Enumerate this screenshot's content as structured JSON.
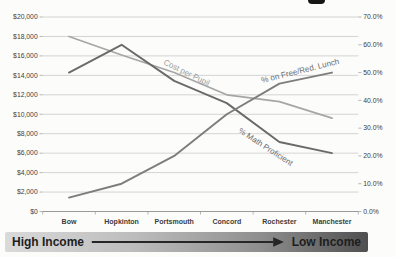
{
  "banner": {
    "left_label": "High Income",
    "right_label": "Low Income",
    "arrow_color": "#262626"
  },
  "chart_data": {
    "type": "line",
    "title": "",
    "categories": [
      "Bow",
      "Hopkinton",
      "Portsmouth",
      "Concord",
      "Rochester",
      "Manchester"
    ],
    "series": [
      {
        "name": "Cost per Pupil",
        "axis": "left",
        "values": [
          18000,
          16100,
          14300,
          12000,
          11300,
          9600
        ],
        "color": "#a6a6a6",
        "label_color": "#9c9c9c"
      },
      {
        "name": "% Math Proficient",
        "axis": "right",
        "values": [
          50,
          60,
          47,
          39,
          25,
          21
        ],
        "color": "#6a6a6a",
        "label_color": "#6b6b6b"
      },
      {
        "name": "% on Free/Red. Lunch",
        "axis": "right",
        "values": [
          5,
          10,
          20,
          35,
          46,
          50
        ],
        "color": "#7d7d7d",
        "label_color": "#6b6b6b"
      }
    ],
    "left_axis": {
      "min": 0,
      "max": 20000,
      "step": 2000,
      "tick_labels": [
        "$20,000",
        "$18,000",
        "$16,000",
        "$14,000",
        "$12,000",
        "$10,000",
        "$8,000",
        "$6,000",
        "$4,000",
        "$2,000",
        "$0"
      ]
    },
    "right_axis": {
      "min": 0,
      "max": 70,
      "step": 10,
      "tick_labels": [
        "70.0%",
        "60.0%",
        "50.0%",
        "40.0%",
        "30.0%",
        "20.0%",
        "10.0%",
        "0.0%"
      ]
    },
    "grid": true,
    "legend": "inline-rotated-labels",
    "colors": {
      "gridline": "#c9c9c9",
      "axis_line": "#9a9a9a",
      "tick_text": "#3c3c3c"
    }
  }
}
